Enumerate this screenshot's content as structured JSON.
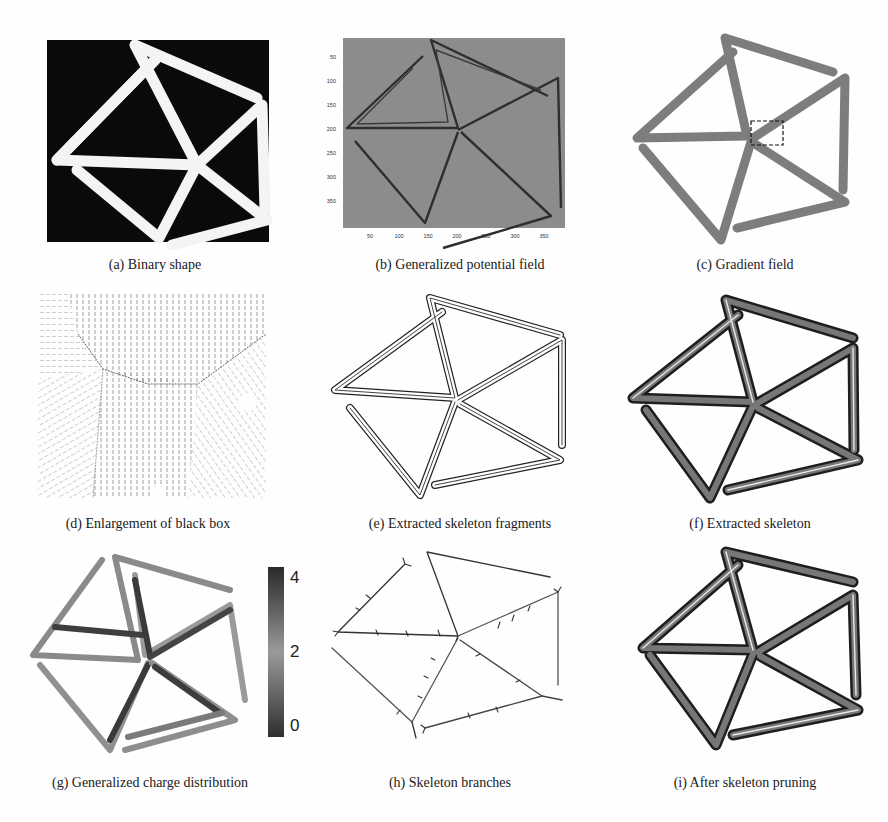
{
  "figure": {
    "panels": [
      {
        "id": "a",
        "caption": "(a) Binary shape"
      },
      {
        "id": "b",
        "caption": "(b) Generalized potential field",
        "axes": {
          "y_ticks": [
            "50",
            "100",
            "150",
            "200",
            "250",
            "300",
            "350"
          ],
          "x_ticks": [
            "50",
            "100",
            "150",
            "200",
            "250",
            "300",
            "350"
          ]
        }
      },
      {
        "id": "c",
        "caption": "(c) Gradient field",
        "annotation": "dashed black box at central junction"
      },
      {
        "id": "d",
        "caption": "(d) Enlargement of black box"
      },
      {
        "id": "e",
        "caption": "(e) Extracted skeleton fragments"
      },
      {
        "id": "f",
        "caption": "(f) Extracted skeleton"
      },
      {
        "id": "g",
        "caption": "(g) Generalized charge distribution",
        "colorbar": {
          "ticks": [
            "4",
            "2",
            "0"
          ]
        }
      },
      {
        "id": "h",
        "caption": "(h) Skeleton branches"
      },
      {
        "id": "i",
        "caption": "(i) After skeleton pruning"
      }
    ]
  }
}
